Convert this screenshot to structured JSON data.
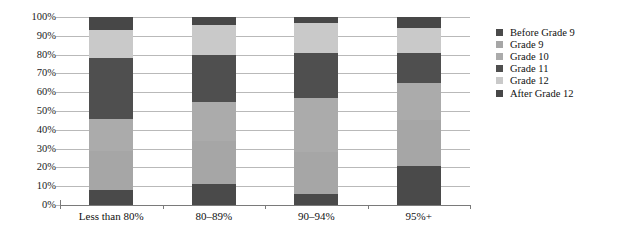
{
  "chart_data": {
    "type": "bar",
    "subtype": "stacked-percentage-column",
    "title": "",
    "subtitle": "",
    "xlabel": "",
    "ylabel": "",
    "categories": [
      "Less than 80%",
      "80–89%",
      "90–94%",
      "95%+"
    ],
    "ylim": [
      0,
      100
    ],
    "ytick_labels": [
      "0%",
      "10%",
      "20%",
      "30%",
      "40%",
      "50%",
      "60%",
      "70%",
      "80%",
      "90%",
      "100%"
    ],
    "ytick_values": [
      0,
      10,
      20,
      30,
      40,
      50,
      60,
      70,
      80,
      90,
      100
    ],
    "grid": true,
    "legend_position": "right",
    "stack_order_bottom_to_top": [
      "Before Grade 9",
      "Grade 9",
      "Grade 10",
      "Grade 11",
      "Grade 12",
      "After Grade 12"
    ],
    "series": [
      {
        "name": "Before Grade 9",
        "color": "#4a4a4a",
        "values": [
          8,
          11,
          6,
          21
        ]
      },
      {
        "name": "Grade 9",
        "color": "#a6a6a6",
        "values": [
          21,
          23,
          22,
          24
        ]
      },
      {
        "name": "Grade 10",
        "color": "#ababab",
        "values": [
          17,
          21,
          29,
          20
        ]
      },
      {
        "name": "Grade 11",
        "color": "#4f4f4f",
        "values": [
          32,
          25,
          24,
          16
        ]
      },
      {
        "name": "Grade 12",
        "color": "#c9c9c9",
        "values": [
          15,
          16,
          16,
          13
        ]
      },
      {
        "name": "After Grade 12",
        "color": "#474747",
        "values": [
          7,
          4,
          3,
          6
        ]
      }
    ]
  },
  "legend": {
    "items": [
      {
        "label": "Before Grade 9",
        "color": "#4a4a4a"
      },
      {
        "label": "Grade 9",
        "color": "#a6a6a6"
      },
      {
        "label": "Grade 10",
        "color": "#ababab"
      },
      {
        "label": "Grade 11",
        "color": "#4f4f4f"
      },
      {
        "label": "Grade 12",
        "color": "#c9c9c9"
      },
      {
        "label": "After Grade 12",
        "color": "#474747"
      }
    ]
  },
  "axes": {
    "y_ticks": [
      "100%",
      "90%",
      "80%",
      "70%",
      "60%",
      "50%",
      "40%",
      "30%",
      "20%",
      "10%",
      "0%"
    ],
    "x_ticks": [
      "Less than 80%",
      "80–89%",
      "90–94%",
      "95%+"
    ]
  },
  "colors": {
    "gridline": "#b9b9b9",
    "axis": "#7a7a7a",
    "text": "#111111",
    "background": "#ffffff"
  }
}
